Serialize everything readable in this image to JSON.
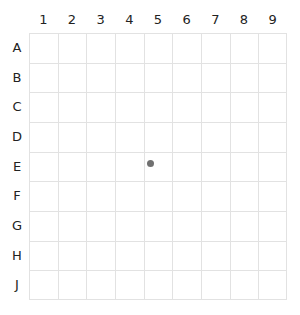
{
  "grid": {
    "columns": [
      "1",
      "2",
      "3",
      "4",
      "5",
      "6",
      "7",
      "8",
      "9"
    ],
    "rows": [
      "A",
      "B",
      "C",
      "D",
      "E",
      "F",
      "G",
      "H",
      "J"
    ],
    "line_color": "#e2e2e2"
  },
  "marker": {
    "cell": "E5",
    "row": "E",
    "column": "5",
    "color": "#707070"
  }
}
